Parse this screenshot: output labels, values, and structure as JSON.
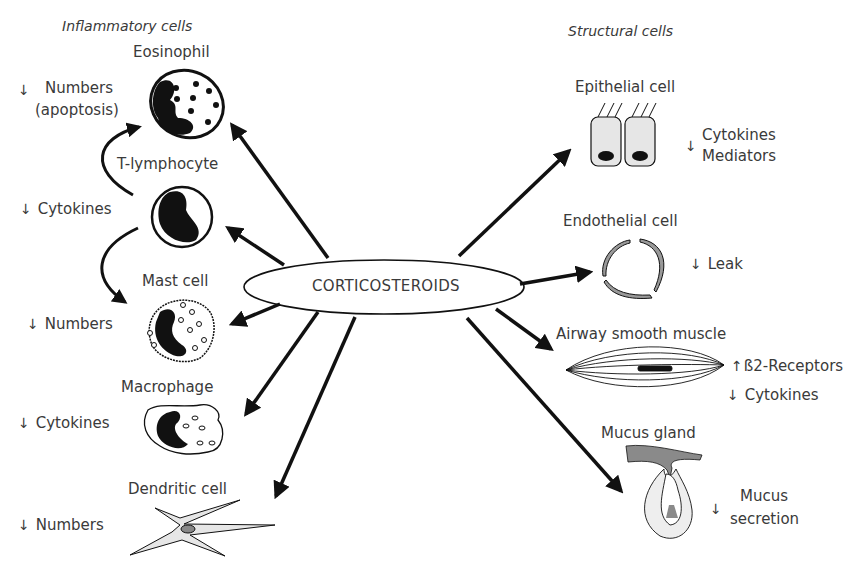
{
  "diagram": {
    "hub": {
      "label": "CORTICOSTEROIDS"
    },
    "groups": {
      "inflammatory": "Inflammatory cells",
      "structural": "Structural cells"
    },
    "inflammatory_cells": [
      {
        "name": "Eosinophil",
        "effect_arrow": "↓",
        "effect_lines": [
          "Numbers",
          "(apoptosis)"
        ]
      },
      {
        "name": "T-lymphocyte",
        "effect_arrow": "↓",
        "effect_lines": [
          "Cytokines"
        ]
      },
      {
        "name": "Mast cell",
        "effect_arrow": "↓",
        "effect_lines": [
          "Numbers"
        ]
      },
      {
        "name": "Macrophage",
        "effect_arrow": "↓",
        "effect_lines": [
          "Cytokines"
        ]
      },
      {
        "name": "Dendritic cell",
        "effect_arrow": "↓",
        "effect_lines": [
          "Numbers"
        ]
      }
    ],
    "structural_cells": [
      {
        "name": "Epithelial cell",
        "effect_arrow": "↓",
        "effect_lines": [
          "Cytokines",
          "Mediators"
        ]
      },
      {
        "name": "Endothelial cell",
        "effect_arrow": "↓",
        "effect_lines": [
          "Leak"
        ]
      },
      {
        "name": "Airway smooth muscle",
        "effects": [
          {
            "arrow": "↑",
            "text": "ß2-Receptors"
          },
          {
            "arrow": "↓",
            "text": "Cytokines"
          }
        ]
      },
      {
        "name": "Mucus gland",
        "effect_arrow": "↓",
        "effect_lines": [
          "Mucus",
          "secretion"
        ]
      }
    ],
    "colors": {
      "ink": "#111111",
      "text": "#3a3a3a",
      "cell_fill": "#e6e6e6",
      "gland_dark": "#8a8a8a"
    }
  }
}
